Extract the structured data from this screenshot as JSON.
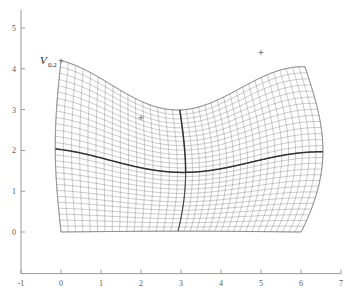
{
  "figure": {
    "background_color": "#ffffff",
    "axis_color": "#999999",
    "mesh_color": "#6e6e6e",
    "block_boundary_color": "#2a2a2a",
    "label_color": "#1a1a1a",
    "tick_label_color": "#5a5a5a"
  },
  "annotations": {
    "corner_label": {
      "base": "V",
      "subscript": "0,2",
      "x": 0.0,
      "y": 4.2
    },
    "markers": [
      {
        "name": "plus-marker-upper-right",
        "symbol": "+",
        "x": 5.0,
        "y": 4.4
      },
      {
        "name": "plus-marker-mid-left",
        "symbol": "+",
        "x": 2.0,
        "y": 2.8
      }
    ]
  },
  "chart_data": {
    "type": "line",
    "title": "",
    "xlabel": "",
    "ylabel": "",
    "xlim": [
      -1,
      7
    ],
    "ylim": [
      -1,
      5.4
    ],
    "grid": false,
    "legend": "none",
    "xticks": [
      -1,
      0,
      1,
      2,
      3,
      4,
      5,
      6,
      7
    ],
    "xtick_labels": [
      "-1",
      "0",
      "1",
      "2",
      "3",
      "4",
      "5",
      "6",
      "7"
    ],
    "yticks": [
      0,
      1,
      2,
      3,
      4,
      5
    ],
    "ytick_labels": [
      "0",
      "1",
      "2",
      "3",
      "4",
      "5"
    ],
    "blocks": [
      {
        "name": "block-lower-left",
        "i_cells": 16,
        "j_cells": 14,
        "corners": [
          [
            0.0,
            0.0
          ],
          [
            3.0,
            0.0
          ],
          [
            3.0,
            2.0
          ],
          [
            -0.1,
            1.6
          ]
        ]
      },
      {
        "name": "block-upper-left",
        "i_cells": 16,
        "j_cells": 14,
        "corners": [
          [
            -0.1,
            1.6
          ],
          [
            3.0,
            2.0
          ],
          [
            3.5,
            3.6
          ],
          [
            0.0,
            4.2
          ]
        ]
      },
      {
        "name": "block-lower-right",
        "i_cells": 20,
        "j_cells": 14,
        "corners": [
          [
            3.0,
            0.0
          ],
          [
            6.0,
            0.0
          ],
          [
            6.5,
            2.0
          ],
          [
            3.0,
            2.0
          ]
        ]
      },
      {
        "name": "block-upper-right",
        "i_cells": 20,
        "j_cells": 14,
        "corners": [
          [
            3.0,
            2.0
          ],
          [
            6.5,
            2.0
          ],
          [
            6.1,
            4.05
          ],
          [
            3.5,
            3.6
          ]
        ]
      }
    ],
    "boundaries": {
      "top_curve_note": "sinusoidal: high at x=0 (y=4.2), trough near x=2.3 (y=3.05), crest near x=5.2 (y=4.15)",
      "bottom_curve_note": "flat at y=0 from x=0 to x=6",
      "left_edge_note": "nearly vertical from (0,0) to (0,4.2), slight outward lean near y=1.6",
      "right_edge_note": "bulges to x=6.5 at y=2, returns to x=6 at y=0 and x=6.1 at y=4.05"
    }
  }
}
